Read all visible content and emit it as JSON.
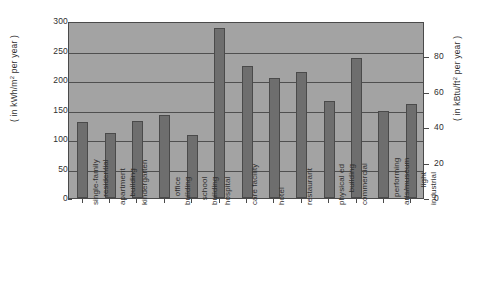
{
  "chart_data": {
    "type": "bar",
    "title": "",
    "xlabel": "",
    "ylabel": "( in kWh/m² per year )",
    "ylabel_left_pre": "( in kWh/m",
    "ylabel_left_sup": "2",
    "ylabel_left_post": " per year )",
    "ylabel_right_pre": "( in kBtu/ft",
    "ylabel_right_sup": "2",
    "ylabel_right_post": " per year )",
    "ylabel_right": "( in kBtu/ft² per year )",
    "ylim": [
      0,
      300
    ],
    "ylim_right": [
      0,
      100
    ],
    "yticks": [
      0,
      50,
      100,
      150,
      200,
      250,
      300
    ],
    "yticks_right": [
      0,
      20,
      40,
      60,
      80
    ],
    "grid": true,
    "legend": "none",
    "categories": [
      "single-family residential",
      "apartment building",
      "kindergarten",
      "office building",
      "school building",
      "hospital",
      "care facility",
      "hotel",
      "restaurant",
      "physical ed building",
      "commercial",
      "performing arts/museum",
      "light industrial"
    ],
    "category_lines": [
      [
        "single-family",
        "residential"
      ],
      [
        "apartment",
        "building"
      ],
      [
        "kindergarten",
        ""
      ],
      [
        "office",
        "building"
      ],
      [
        "school",
        "building"
      ],
      [
        "hospital",
        ""
      ],
      [
        "care facility",
        ""
      ],
      [
        "hotel",
        ""
      ],
      [
        "restaurant",
        ""
      ],
      [
        "physical ed",
        "building"
      ],
      [
        "commercial",
        ""
      ],
      [
        "performing",
        "arts/museum"
      ],
      [
        "light",
        "industrial"
      ]
    ],
    "values": [
      128,
      110,
      131,
      141,
      106,
      289,
      223,
      203,
      213,
      164,
      238,
      148,
      159
    ],
    "bar_color": "#6e6e6e",
    "plot_background": "#a3a3a3",
    "axis_color": "#4a4a4a"
  }
}
